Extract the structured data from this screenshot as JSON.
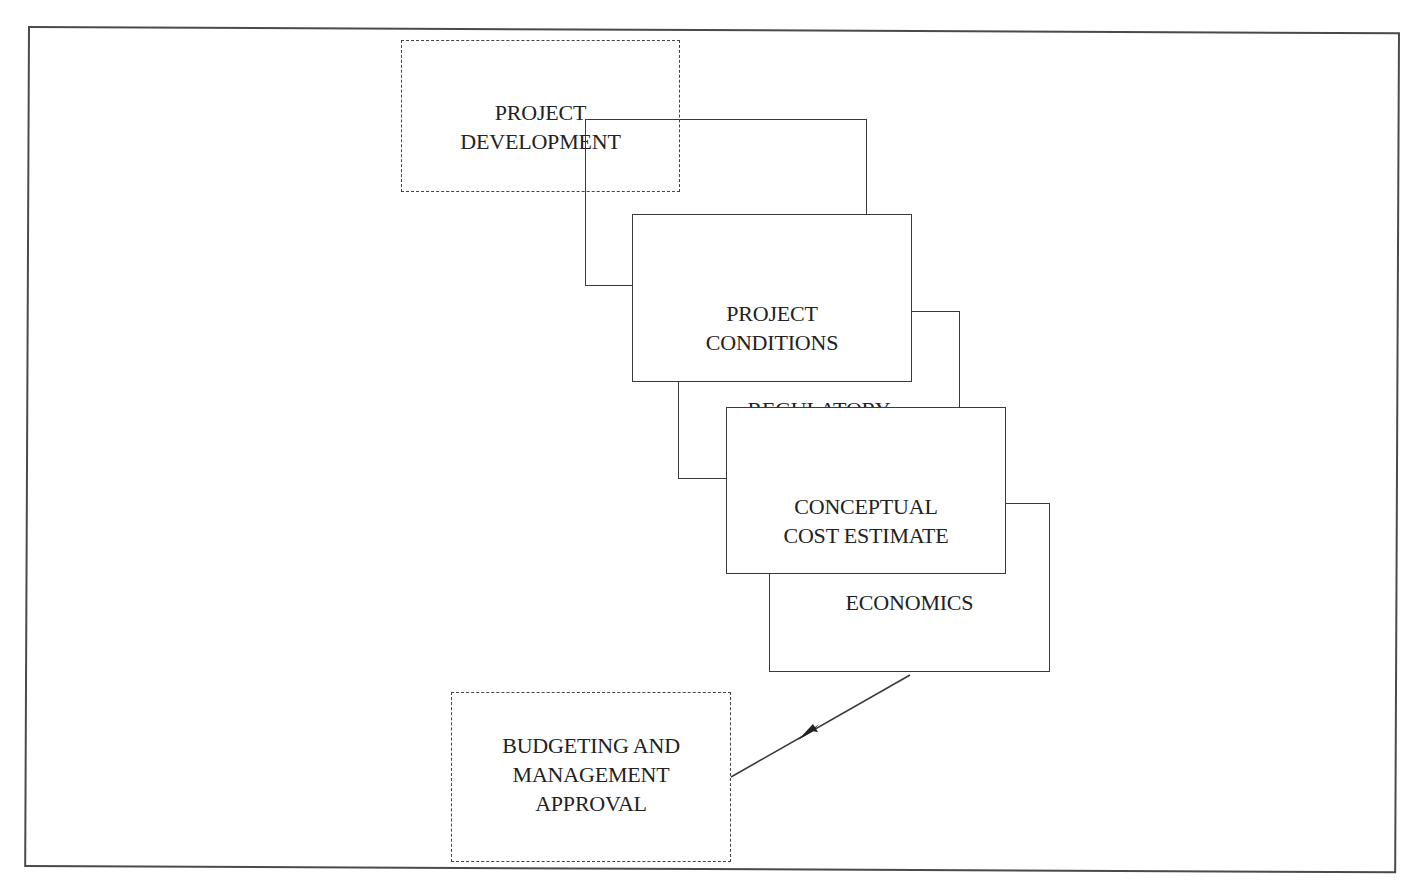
{
  "diagram": {
    "type": "cascading-flow",
    "nodes": [
      {
        "id": "project_development",
        "label": "PROJECT\nDEVELOPMENT",
        "style": "dashed"
      },
      {
        "id": "technical",
        "label": "TECHNICAL",
        "style": "solid"
      },
      {
        "id": "project_conditions",
        "label": "PROJECT\nCONDITIONS",
        "style": "solid"
      },
      {
        "id": "regulatory",
        "label": "REGULATORY",
        "style": "solid"
      },
      {
        "id": "conceptual_cost_estimate",
        "label": "CONCEPTUAL\nCOST ESTIMATE",
        "style": "solid"
      },
      {
        "id": "economics",
        "label": "ECONOMICS",
        "style": "solid"
      },
      {
        "id": "budgeting_management_approval",
        "label": "BUDGETING AND\nMANAGEMENT\nAPPROVAL",
        "style": "dashed"
      }
    ],
    "edges": [
      {
        "from": "economics",
        "to": "budgeting_management_approval",
        "type": "arrow"
      }
    ]
  },
  "colors": {
    "line": "#3a3a3a",
    "frame": "#4a4a4a",
    "background": "#ffffff",
    "text": "#222222"
  }
}
